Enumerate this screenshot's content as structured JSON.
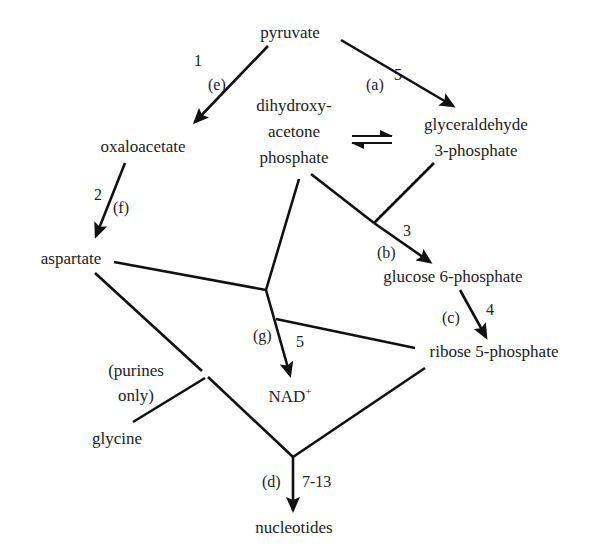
{
  "diagram": {
    "nodes": {
      "pyruvate": "pyruvate",
      "oxaloacetate": "oxaloacetate",
      "dhap_line1": "dihydroxy-",
      "dhap_line2": "acetone",
      "dhap_line3": "phosphate",
      "g3p_line1": "glyceraldehyde",
      "g3p_line2": "3-phosphate",
      "aspartate": "aspartate",
      "glucose6p": "glucose 6-phosphate",
      "ribose5p": "ribose 5-phosphate",
      "nad": "NAD",
      "nad_sup": "+",
      "purines_line1": "(purines",
      "purines_line2": "only)",
      "glycine": "glycine",
      "nucleotides": "nucleotides"
    },
    "step_labels": {
      "pyr_oaa_num": "1",
      "pyr_oaa_letter": "(e)",
      "pyr_g3p_num": "5",
      "pyr_g3p_letter": "(a)",
      "oaa_asp_num": "2",
      "oaa_asp_letter": "(f)",
      "to_g6p_num": "3",
      "to_g6p_letter": "(b)",
      "g6p_r5p_num": "4",
      "g6p_r5p_letter": "(c)",
      "to_nad_num": "5",
      "to_nad_letter": "(g)",
      "to_nuc_num": "7-13",
      "to_nuc_letter": "(d)"
    },
    "edges": [
      {
        "from": "pyruvate",
        "to": "oxaloacetate",
        "step": "1",
        "letter": "(e)"
      },
      {
        "from": "pyruvate",
        "to": "glyceraldehyde 3-phosphate",
        "step": "5",
        "letter": "(a)"
      },
      {
        "from": "dihydroxyacetone phosphate",
        "to": "glyceraldehyde 3-phosphate",
        "type": "equilibrium"
      },
      {
        "from": "oxaloacetate",
        "to": "aspartate",
        "step": "2",
        "letter": "(f)"
      },
      {
        "from": [
          "dihydroxyacetone phosphate",
          "glyceraldehyde 3-phosphate"
        ],
        "to": "glucose 6-phosphate",
        "step": "3",
        "letter": "(b)"
      },
      {
        "from": "glucose 6-phosphate",
        "to": "ribose 5-phosphate",
        "step": "4",
        "letter": "(c)"
      },
      {
        "from": [
          "aspartate",
          "dihydroxyacetone phosphate",
          "ribose 5-phosphate"
        ],
        "to": "NAD+",
        "step": "5",
        "letter": "(g)"
      },
      {
        "from": [
          "aspartate",
          "glycine (purines only)",
          "ribose 5-phosphate"
        ],
        "to": "nucleotides",
        "step": "7-13",
        "letter": "(d)"
      }
    ]
  }
}
